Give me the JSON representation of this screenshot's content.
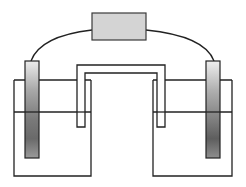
{
  "diagram": {
    "type": "galvanic-cell",
    "components": {
      "meter": {
        "label": "",
        "fill": "#d4d4d4",
        "stroke": "#3a3a3a"
      },
      "left_electrode": {
        "label": ""
      },
      "right_electrode": {
        "label": ""
      },
      "left_beaker": {
        "label": ""
      },
      "right_beaker": {
        "label": ""
      },
      "salt_bridge": {
        "label": ""
      },
      "wire": {
        "label": ""
      }
    },
    "colors": {
      "line": "#222222",
      "electrode_light": "#e6e6e6",
      "electrode_dark": "#6e6e6e",
      "meter_fill": "#d4d4d4",
      "background": "#ffffff"
    }
  }
}
